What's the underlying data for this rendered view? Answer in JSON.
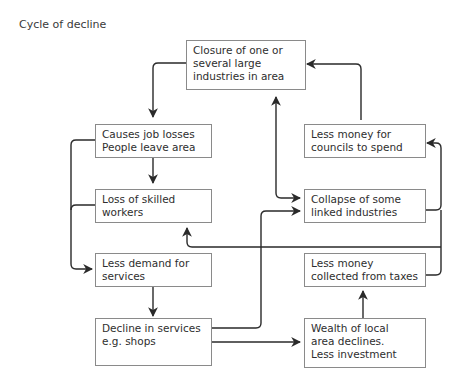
{
  "title": "Cycle of decline",
  "nodes": {
    "closure": "Closure of one or\nseveral large\nindustries in area",
    "job_losses": "Causes job losses\nPeople leave area",
    "skilled": "Loss of skilled\nworkers",
    "demand": "Less demand for\nservices",
    "decline_services": "Decline in services\ne.g. shops",
    "councils": "Less money for\ncouncils to spend",
    "collapse": "Collapse of some\nlinked industries",
    "taxes": "Less money\ncollected from taxes",
    "wealth": "Wealth of local\narea declines.\nLess investment"
  },
  "edges": [
    {
      "from": "closure",
      "to": "job_losses"
    },
    {
      "from": "job_losses",
      "to": "skilled"
    },
    {
      "from": "job_losses",
      "to": "demand"
    },
    {
      "from": "skilled",
      "to": "demand"
    },
    {
      "from": "demand",
      "to": "decline_services"
    },
    {
      "from": "decline_services",
      "to": "wealth"
    },
    {
      "from": "decline_services",
      "to": "collapse"
    },
    {
      "from": "wealth",
      "to": "taxes"
    },
    {
      "from": "taxes",
      "to": "councils"
    },
    {
      "from": "collapse",
      "to": "councils"
    },
    {
      "from": "councils",
      "to": "closure"
    },
    {
      "from": "collapse",
      "to": "closure",
      "bidirectional": true
    },
    {
      "from": "taxes",
      "to": "skilled"
    }
  ],
  "colors": {
    "line": "#2a2a2a",
    "border": "#8a8a8a"
  }
}
